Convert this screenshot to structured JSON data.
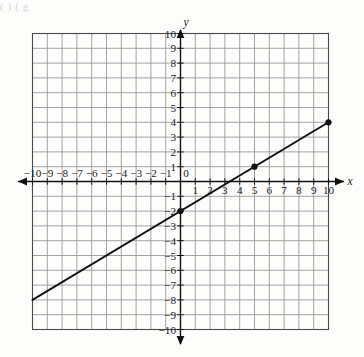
{
  "page": {
    "cropped_header_text": "(     )                                                                 (          g"
  },
  "graph": {
    "axis_labels": {
      "x": "x",
      "y": "y"
    },
    "origin_label": "0",
    "x_tick_labels_negative": [
      "−10",
      "−9",
      "−8",
      "−7",
      "−6",
      "−5",
      "−4",
      "−3",
      "−2",
      "−1"
    ],
    "x_tick_labels_positive": [
      "1",
      "2",
      "3",
      "4",
      "5",
      "6",
      "7",
      "8",
      "9",
      "10"
    ],
    "y_tick_labels_positive": [
      "1",
      "2",
      "3",
      "4",
      "5",
      "6",
      "7",
      "8",
      "9",
      "10"
    ],
    "y_tick_labels_negative": [
      "−1",
      "−2",
      "−3",
      "−4",
      "−5",
      "−6",
      "−7",
      "−8",
      "−9",
      "−10"
    ],
    "colors": {
      "grid": "#9a9a9a",
      "border": "#4a4a4a",
      "axis": "#111111",
      "line": "#111111",
      "point": "#111111",
      "background": "#fdfdfc"
    }
  },
  "chart_data": {
    "type": "line",
    "title": "",
    "xlabel": "x",
    "ylabel": "y",
    "xlim": [
      -10,
      10
    ],
    "ylim": [
      -10,
      10
    ],
    "xticks": [
      -10,
      -9,
      -8,
      -7,
      -6,
      -5,
      -4,
      -3,
      -2,
      -1,
      0,
      1,
      2,
      3,
      4,
      5,
      6,
      7,
      8,
      9,
      10
    ],
    "yticks": [
      -10,
      -9,
      -8,
      -7,
      -6,
      -5,
      -4,
      -3,
      -2,
      -1,
      0,
      1,
      2,
      3,
      4,
      5,
      6,
      7,
      8,
      9,
      10
    ],
    "grid": true,
    "legend": null,
    "series": [
      {
        "name": "line",
        "equation": "y = 0.6x - 2",
        "slope": 0.6,
        "intercept": -2,
        "x": [
          -10,
          10
        ],
        "values": [
          -8,
          4
        ]
      }
    ],
    "marked_points": [
      {
        "x": 0,
        "y": -2
      },
      {
        "x": 5,
        "y": 1
      },
      {
        "x": 10,
        "y": 4
      }
    ]
  }
}
